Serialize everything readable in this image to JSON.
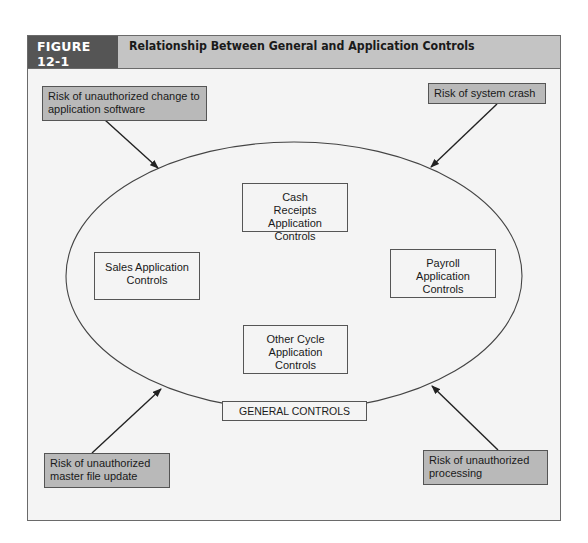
{
  "figure": {
    "label": "FIGURE 12-1",
    "title": "Relationship Between General and Application Controls"
  },
  "colors": {
    "header_bg": "#c4c4c4",
    "label_bg": "#555555",
    "risk_box_bg": "#b9b9b9",
    "panel_bg": "#f4f4f4",
    "line": "#333333"
  },
  "risks": {
    "top_left": "Risk of unauthorized change to application software",
    "top_right": "Risk of system crash",
    "bottom_left": "Risk of unauthorized master file update",
    "bottom_right": "Risk of unauthorized processing"
  },
  "application_controls": {
    "top": "Cash Receipts Application Controls",
    "left": "Sales Application Controls",
    "right": "Payroll Application Controls",
    "bottom": "Other Cycle Application Controls"
  },
  "general_controls": {
    "label": "GENERAL CONTROLS"
  },
  "diagram": {
    "ellipse": {
      "cx": 294,
      "cy": 276,
      "rx": 228,
      "ry": 134
    },
    "arrows": [
      {
        "from": "top_left",
        "x1": 105,
        "y1": 120,
        "x2": 158,
        "y2": 168
      },
      {
        "from": "top_right",
        "x1": 497,
        "y1": 104,
        "x2": 431,
        "y2": 167
      },
      {
        "from": "bottom_left",
        "x1": 92,
        "y1": 424,
        "x2": 161,
        "y2": 389
      },
      {
        "from": "bottom_right",
        "x1": 498,
        "y1": 450,
        "x2": 432,
        "y2": 386
      }
    ]
  }
}
